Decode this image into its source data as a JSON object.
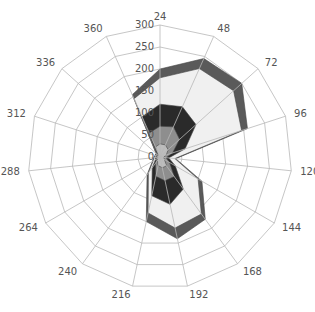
{
  "chart_data": {
    "type": "radar",
    "title": "",
    "angular_categories": [
      "24",
      "48",
      "72",
      "96",
      "120",
      "144",
      "168",
      "192",
      "216",
      "240",
      "264",
      "288",
      "312",
      "336",
      "360"
    ],
    "radial_ticks": [
      0,
      50,
      100,
      150,
      200,
      250,
      300
    ],
    "radial_range": [
      0,
      300
    ],
    "grid": true,
    "stacked_area": true,
    "series": [
      {
        "name": "layer-1 (outer band)",
        "color": "#5a5a5a",
        "values": [
          200,
          245,
          250,
          209,
          36,
          110,
          175,
          190,
          150,
          50,
          20,
          15,
          12,
          12,
          155
        ]
      },
      {
        "name": "layer-2 (light fill)",
        "color": "#f0f0f0",
        "values": [
          180,
          220,
          225,
          195,
          34,
          100,
          160,
          165,
          130,
          45,
          18,
          13,
          11,
          11,
          145
        ]
      },
      {
        "name": "layer-3 (black)",
        "color": "#2a2a2a",
        "values": [
          120,
          125,
          110,
          60,
          20,
          40,
          90,
          110,
          90,
          30,
          12,
          10,
          9,
          9,
          100
        ]
      },
      {
        "name": "layer-4 (mid grey)",
        "color": "#8e8e8e",
        "values": [
          70,
          75,
          60,
          30,
          14,
          25,
          55,
          55,
          45,
          18,
          9,
          8,
          7,
          7,
          60
        ]
      },
      {
        "name": "layer-5 (inner)",
        "color": "#bdbdbd",
        "values": [
          30,
          30,
          25,
          15,
          8,
          12,
          25,
          25,
          20,
          10,
          6,
          5,
          5,
          5,
          25
        ]
      }
    ]
  },
  "labels": {
    "angular": [
      "24",
      "48",
      "72",
      "96",
      "120",
      "144",
      "168",
      "192",
      "216",
      "240",
      "264",
      "288",
      "312",
      "336",
      "360"
    ],
    "radial": [
      "0",
      "50",
      "100",
      "150",
      "200",
      "250",
      "300"
    ]
  }
}
